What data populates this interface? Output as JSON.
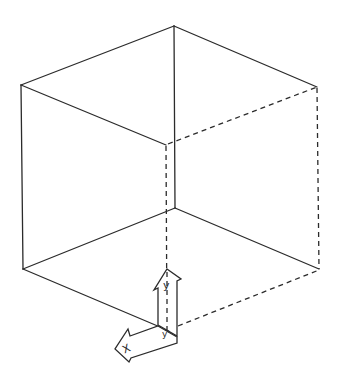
{
  "diagram": {
    "title": "",
    "colors": {
      "line": "#2b2b2b",
      "background": "#ffffff"
    },
    "vertices": {
      "top_back": [
        174,
        26
      ],
      "top_left": [
        21,
        85
      ],
      "top_right": [
        317,
        87
      ],
      "top_front_hidden": [
        166,
        145
      ],
      "bottom_back": [
        175,
        208
      ],
      "bottom_left": [
        23,
        269
      ],
      "bottom_right": [
        319,
        269
      ],
      "bottom_front_hidden": [
        167,
        333
      ]
    },
    "axes": {
      "y_label": "y",
      "x_label": "X",
      "origin_label": "y'"
    }
  }
}
